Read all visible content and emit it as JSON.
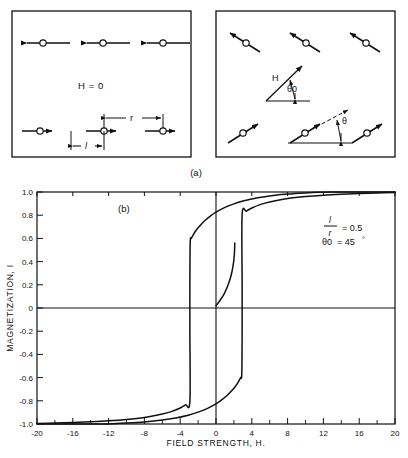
{
  "figure": {
    "panel_a_label": "(a)",
    "panel_b_label": "(b)"
  },
  "panel_a": {
    "left_box": {
      "field_label": "H = 0",
      "spacing_label": "r",
      "length_label": "l",
      "dipole_rows": [
        {
          "direction": "left",
          "count": 3
        },
        {
          "direction": "right",
          "count": 3
        }
      ]
    },
    "right_box": {
      "field_vector_label": "H",
      "field_angle_label": "θ0",
      "moment_angle_label": "θ",
      "dipole_rows": [
        {
          "direction": "up-left",
          "count": 3
        },
        {
          "direction": "up-right",
          "count": 3
        }
      ]
    }
  },
  "chart_data": {
    "type": "line",
    "title": "(b)",
    "xlabel": "FIELD STRENGTH, H.",
    "ylabel": "MAGNETIZATION, I",
    "xlim": [
      -20,
      20
    ],
    "ylim": [
      -1.0,
      1.0
    ],
    "grid": false,
    "legend": "none",
    "xticks": [
      -20,
      -16,
      -12,
      -8,
      -4,
      0,
      4,
      8,
      12,
      16,
      20
    ],
    "xtick_labels": [
      "-20",
      "-16",
      "-12",
      "-8",
      "-4",
      "0",
      "4",
      "8",
      "12",
      "16",
      "20"
    ],
    "xminor_step": 2,
    "yticks": [
      -1.0,
      -0.8,
      -0.6,
      -0.4,
      -0.2,
      0,
      0.2,
      0.4,
      0.6,
      0.8,
      1.0
    ],
    "ytick_labels": [
      "-1.0",
      "-0.8",
      "-0.6",
      "-0.4",
      "-0.2",
      "0",
      "0.2",
      "0.4",
      "0.6",
      "0.8",
      "1.0"
    ],
    "annotations": [
      {
        "text": "l/r = 0.5",
        "numerator": "l",
        "denominator": "r",
        "equals": "= 0.5",
        "x": 11,
        "y": 0.78
      },
      {
        "text": "θ0 = 45°",
        "symbol": "θ0",
        "equals": "= 45",
        "degree": "°",
        "x": 11,
        "y": 0.66
      }
    ],
    "series": [
      {
        "name": "upper-branch",
        "comment": "descending-field branch: saturated +1 at high H, drops at H = -2.9",
        "points": [
          [
            20,
            1.0
          ],
          [
            16,
            1.0
          ],
          [
            13,
            0.999
          ],
          [
            11.5,
            0.997
          ],
          [
            10,
            0.992
          ],
          [
            8,
            0.982
          ],
          [
            6,
            0.966
          ],
          [
            4.5,
            0.948
          ],
          [
            3,
            0.922
          ],
          [
            2,
            0.898
          ],
          [
            1,
            0.867
          ],
          [
            0,
            0.826
          ],
          [
            -0.6,
            0.795
          ],
          [
            -1.2,
            0.757
          ],
          [
            -1.8,
            0.71
          ],
          [
            -2.2,
            0.672
          ],
          [
            -2.5,
            0.637
          ],
          [
            -2.75,
            0.6
          ],
          [
            -2.88,
            0.57
          ],
          [
            -2.92,
            0.2
          ],
          [
            -2.92,
            -0.2
          ],
          [
            -2.92,
            -0.805
          ],
          [
            -3.4,
            -0.836
          ],
          [
            -4,
            -0.862
          ],
          [
            -5,
            -0.893
          ],
          [
            -6,
            -0.914
          ],
          [
            -8,
            -0.943
          ],
          [
            -10,
            -0.961
          ],
          [
            -12,
            -0.973
          ],
          [
            -14,
            -0.981
          ],
          [
            -16,
            -0.987
          ],
          [
            -18,
            -0.992
          ],
          [
            -20,
            -0.995
          ]
        ]
      },
      {
        "name": "lower-branch",
        "comment": "ascending-field branch: saturated -1 at low H, jumps up at H = +2.0",
        "points": [
          [
            -20,
            -1.0
          ],
          [
            -16,
            -1.0
          ],
          [
            -13,
            -0.999
          ],
          [
            -11.5,
            -0.997
          ],
          [
            -10,
            -0.992
          ],
          [
            -8,
            -0.982
          ],
          [
            -6,
            -0.966
          ],
          [
            -4.5,
            -0.948
          ],
          [
            -3,
            -0.922
          ],
          [
            -2,
            -0.898
          ],
          [
            -1,
            -0.867
          ],
          [
            0,
            -0.826
          ],
          [
            0.6,
            -0.795
          ],
          [
            1.2,
            -0.757
          ],
          [
            1.8,
            -0.71
          ],
          [
            2.2,
            -0.672
          ],
          [
            2.5,
            -0.637
          ],
          [
            2.75,
            -0.6
          ],
          [
            2.88,
            -0.57
          ],
          [
            2.92,
            -0.2
          ],
          [
            2.92,
            0.2
          ],
          [
            2.92,
            0.805
          ],
          [
            3.4,
            0.836
          ],
          [
            4,
            0.862
          ],
          [
            5,
            0.893
          ],
          [
            6,
            0.914
          ],
          [
            8,
            0.943
          ],
          [
            10,
            0.961
          ],
          [
            12,
            0.973
          ],
          [
            14,
            0.981
          ],
          [
            16,
            0.987
          ],
          [
            18,
            0.992
          ],
          [
            20,
            0.995
          ]
        ]
      },
      {
        "name": "inner-recoil-branch",
        "comment": "inner minor loop segment from origin region rising to the jump point",
        "points": [
          [
            0,
            0.02
          ],
          [
            0.4,
            0.06
          ],
          [
            0.9,
            0.12
          ],
          [
            1.3,
            0.19
          ],
          [
            1.65,
            0.27
          ],
          [
            1.9,
            0.36
          ],
          [
            2.05,
            0.46
          ],
          [
            2.1,
            0.56
          ]
        ]
      }
    ]
  }
}
